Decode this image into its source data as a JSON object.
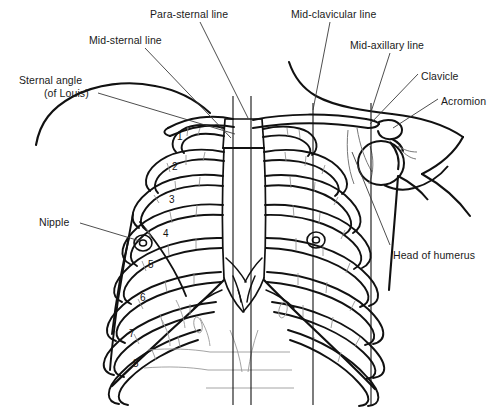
{
  "figure": {
    "background_color": "#ffffff",
    "line_color": "#111111",
    "leader_color": "#3a3a3a",
    "width": 495,
    "height": 413
  },
  "labels": [
    {
      "id": "para-sternal-line",
      "text": "Para-sternal line",
      "x": 150,
      "y": 8,
      "align": "left"
    },
    {
      "id": "mid-sternal-line",
      "text": "Mid-sternal line",
      "x": 89,
      "y": 34,
      "align": "left"
    },
    {
      "id": "sternal-angle",
      "text": "Sternal angle",
      "x": 19,
      "y": 74,
      "align": "left"
    },
    {
      "id": "sternal-angle-louis",
      "text": "(of Louis)",
      "x": 44,
      "y": 87,
      "align": "left"
    },
    {
      "id": "nipple",
      "text": "Nipple",
      "x": 39,
      "y": 216,
      "align": "left"
    },
    {
      "id": "mid-clavicular-line",
      "text": "Mid-clavicular line",
      "x": 291,
      "y": 8,
      "align": "left"
    },
    {
      "id": "mid-axillary-line",
      "text": "Mid-axillary line",
      "x": 350,
      "y": 39,
      "align": "left"
    },
    {
      "id": "clavicle",
      "text": "Clavicle",
      "x": 421,
      "y": 70,
      "align": "left"
    },
    {
      "id": "acromion",
      "text": "Acromion",
      "x": 441,
      "y": 95,
      "align": "left"
    },
    {
      "id": "head-of-humerus",
      "text": "Head of humerus",
      "x": 393,
      "y": 249,
      "align": "left"
    }
  ],
  "rib_numbers": [
    {
      "n": "1",
      "x": 177,
      "y": 131
    },
    {
      "n": "2",
      "x": 172,
      "y": 161
    },
    {
      "n": "3",
      "x": 169,
      "y": 194
    },
    {
      "n": "4",
      "x": 163,
      "y": 228
    },
    {
      "n": "5",
      "x": 148,
      "y": 259
    },
    {
      "n": "6",
      "x": 140,
      "y": 292
    },
    {
      "n": "7",
      "x": 129,
      "y": 328
    },
    {
      "n": "8",
      "x": 133,
      "y": 358
    }
  ],
  "vertical_lines": [
    {
      "id": "mid-sternal-line",
      "x": 233,
      "y1": 96,
      "y2": 405
    },
    {
      "id": "para-sternal-line",
      "x": 251,
      "y1": 96,
      "y2": 405
    },
    {
      "id": "mid-clavicular-line",
      "x": 313,
      "y1": 103,
      "y2": 405
    },
    {
      "id": "mid-axillary-line",
      "x": 371,
      "y1": 103,
      "y2": 405
    }
  ],
  "leader_lines": [
    {
      "id": "para-sternal-leader",
      "x1": 200,
      "y1": 22,
      "x2": 248,
      "y2": 118
    },
    {
      "id": "mid-sternal-leader",
      "x1": 145,
      "y1": 48,
      "x2": 231,
      "y2": 138
    },
    {
      "id": "sternal-angle-leader",
      "x1": 98,
      "y1": 93,
      "x2": 235,
      "y2": 134
    },
    {
      "id": "nipple-leader",
      "x1": 80,
      "y1": 223,
      "x2": 140,
      "y2": 241
    },
    {
      "id": "mid-clavicular-leader",
      "x1": 330,
      "y1": 22,
      "x2": 313,
      "y2": 110
    },
    {
      "id": "mid-axillary-leader",
      "x1": 390,
      "y1": 53,
      "x2": 371,
      "y2": 112
    },
    {
      "id": "clavicle-leader",
      "x1": 418,
      "y1": 74,
      "x2": 370,
      "y2": 124
    },
    {
      "id": "acromion-leader",
      "x1": 438,
      "y1": 99,
      "x2": 393,
      "y2": 128
    },
    {
      "id": "head-of-humerus-leader",
      "x1": 390,
      "y1": 245,
      "x2": 352,
      "y2": 152
    }
  ],
  "annotations": {
    "nipple_left": {
      "cx": 143,
      "cy": 243,
      "r": 9
    },
    "nipple_right": {
      "cx": 316,
      "cy": 240,
      "r": 9
    }
  }
}
